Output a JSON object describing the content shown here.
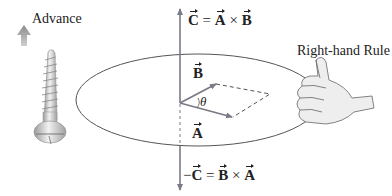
{
  "diagram": {
    "labels": {
      "advance": "Advance",
      "right_hand_rule": "Right-hand Rule",
      "theta": "θ",
      "vector_a": "A",
      "vector_b": "B"
    },
    "equations": {
      "top": {
        "lhs": "C",
        "eq": "=",
        "a": "A",
        "op": "×",
        "b": "B"
      },
      "bottom": {
        "neg": "−",
        "lhs": "C",
        "eq": "=",
        "a": "B",
        "op": "×",
        "b": "A"
      }
    },
    "icons": [
      "advance-arrow-icon",
      "screw-icon",
      "thumbs-up-hand-icon"
    ],
    "colors": {
      "vector": "#7a7a88",
      "arrow_fill": "#8a8a8a",
      "ellipse": "#555555",
      "text": "#222222"
    }
  }
}
